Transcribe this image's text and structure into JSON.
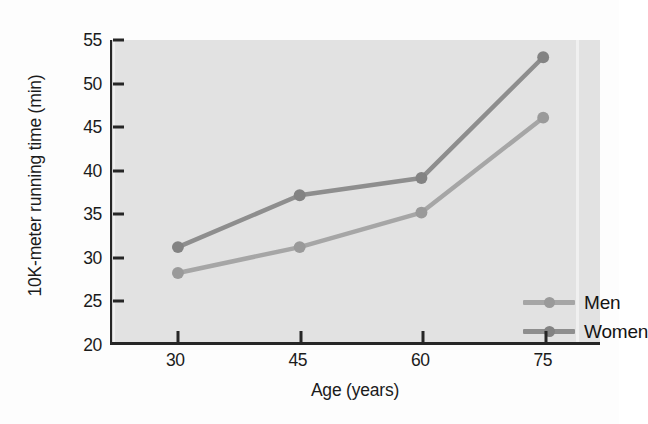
{
  "chart_data": {
    "type": "line",
    "title": "",
    "xlabel": "Age (years)",
    "ylabel": "10K-meter running time (min)",
    "categories": [
      "30",
      "45",
      "60",
      "75"
    ],
    "x": [
      30,
      45,
      60,
      75
    ],
    "xlim": [
      22,
      82
    ],
    "ylim": [
      20,
      55
    ],
    "yticks": [
      "20",
      "25",
      "30",
      "35",
      "40",
      "45",
      "50",
      "55"
    ],
    "ytick_values": [
      20,
      25,
      30,
      35,
      40,
      45,
      50,
      55
    ],
    "grid": false,
    "legend_position": "inside-bottom-right",
    "series": [
      {
        "name": "Men",
        "values": [
          28,
          31,
          35,
          46
        ],
        "color": "#a6a6a6",
        "marker_color": "#9a9a9a"
      },
      {
        "name": "Women",
        "values": [
          31,
          37,
          39,
          53
        ],
        "color": "#8e8e8e",
        "marker_color": "#838383"
      }
    ],
    "plot_background": "#e2e2e2",
    "axis_color": "#262626"
  },
  "legend": {
    "items": [
      {
        "label": "Men"
      },
      {
        "label": "Women"
      }
    ]
  }
}
